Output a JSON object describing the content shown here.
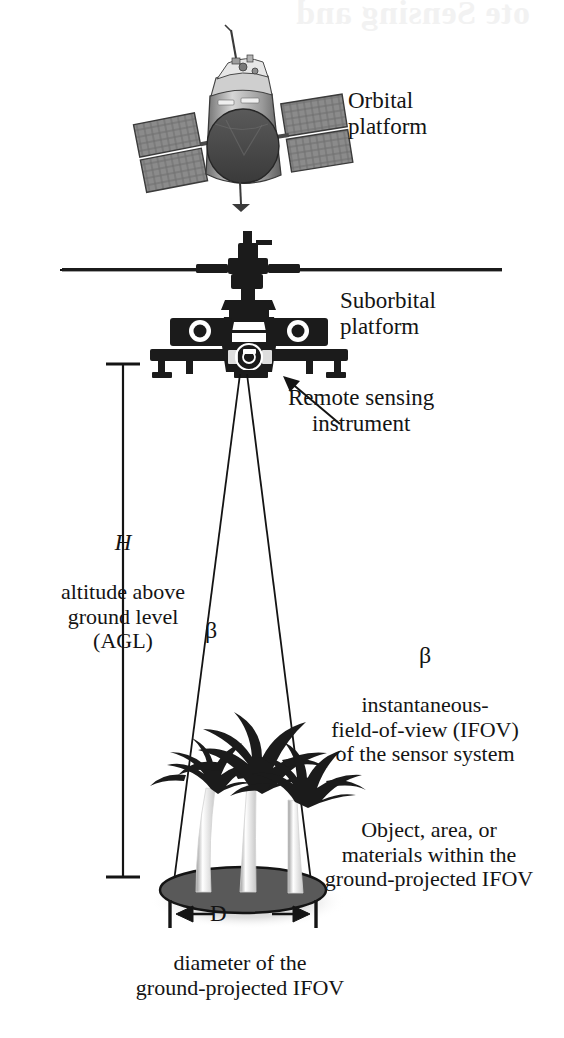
{
  "figure": {
    "bleed_through_text": "ote Sensing and",
    "background_color": "#ffffff",
    "ink_color": "#141414",
    "footprint_fill": "#595959",
    "shadow_color": "#cfcfcf"
  },
  "labels": {
    "orbital_platform": "Orbital\nplatform",
    "suborbital_platform": "Suborbital\nplatform",
    "remote_sensing_instrument": "Remote sensing\ninstrument",
    "altitude_symbol": "H",
    "altitude_text": "altitude above\nground level\n(AGL)",
    "beta_cone_symbol": "β",
    "beta_ifov_symbol": "β",
    "ifov_text": "instantaneous-\nfield-of-view (IFOV)\nof the sensor system",
    "object_text": "Object, area, or\nmaterials within the\nground-projected IFOV",
    "diameter_symbol": "D",
    "diameter_text": "diameter of the\nground-projected IFOV"
  },
  "graphics": {
    "orbital_platform_icon": "satellite-photo",
    "suborbital_platform_icon": "helicopter-front-view",
    "horizon_line": "horizontal-rule",
    "sensor_cone": "ifov-cone",
    "ground_target_icon": "palm-trees",
    "ground_footprint": "ellipse",
    "altitude_dimension": "vertical-dimension-line-H",
    "diameter_dimension": "horizontal-dimension-line-D",
    "instrument_pointer": "arrow-up-left"
  }
}
